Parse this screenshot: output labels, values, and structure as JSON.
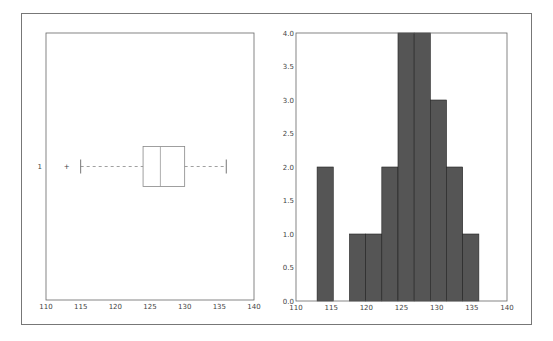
{
  "chart_data": [
    {
      "type": "boxplot",
      "orientation": "horizontal",
      "title": "",
      "xlabel": "",
      "ylabel": "",
      "xlim": [
        110,
        140
      ],
      "xticks": [
        "110",
        "115",
        "120",
        "125",
        "130",
        "135",
        "140"
      ],
      "yticks": [
        "1"
      ],
      "box": {
        "whisker_low": 115,
        "q1": 124,
        "median": 126.5,
        "q3": 130,
        "whisker_high": 136,
        "outliers": [
          113
        ]
      },
      "grid": false
    },
    {
      "type": "bar",
      "subtype": "histogram",
      "title": "",
      "xlabel": "",
      "ylabel": "",
      "xlim": [
        110,
        140
      ],
      "ylim": [
        0,
        4
      ],
      "xticks": [
        "110",
        "115",
        "120",
        "125",
        "130",
        "135",
        "140"
      ],
      "yticks": [
        "0.0",
        "0.5",
        "1.0",
        "1.5",
        "2.0",
        "2.5",
        "3.0",
        "3.5",
        "4.0"
      ],
      "bins": [
        113,
        115.3,
        117.6,
        119.9,
        122.2,
        124.5,
        126.8,
        129.1,
        131.4,
        133.7,
        136
      ],
      "values": [
        2,
        0,
        1,
        1,
        2,
        4,
        4,
        3,
        2,
        1
      ],
      "bar_color": "#555555",
      "grid": false
    }
  ]
}
